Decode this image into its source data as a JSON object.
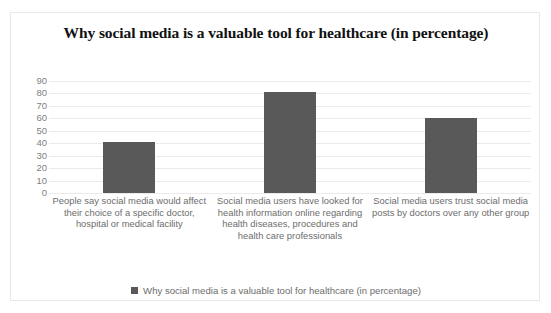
{
  "chart_data": {
    "type": "bar",
    "title": "Why social media is a valuable tool for healthcare (in percentage)",
    "categories": [
      "People say social media would affect their choice of a specific doctor, hospital or medical facility",
      "Social media users have looked for health information online regarding health diseases, procedures and health care professionals",
      "Social media users trust social media posts by doctors over any other group"
    ],
    "values": [
      41,
      81,
      60
    ],
    "series": [
      {
        "name": "Why social media is a valuable tool for healthcare (in percentage)",
        "values": [
          41,
          81,
          60
        ]
      }
    ],
    "xlabel": "",
    "ylabel": "",
    "ylim": [
      0,
      90
    ],
    "yticks": [
      90,
      80,
      70,
      60,
      50,
      40,
      30,
      20,
      10,
      0
    ],
    "grid": true,
    "legend_position": "bottom",
    "bar_color": "#595959",
    "gridline_color": "#eceaea",
    "tick_label_color": "#808080",
    "category_label_color": "#6d6d6d"
  },
  "legend": {
    "entries": [
      {
        "label": "Why social media is a valuable tool for healthcare (in percentage)",
        "color": "#595959"
      }
    ]
  }
}
